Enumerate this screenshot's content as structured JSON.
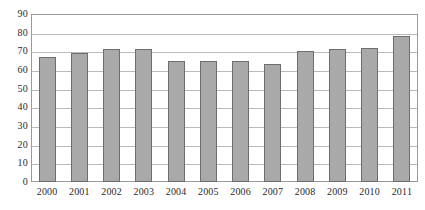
{
  "chart_data": {
    "type": "bar",
    "title": "",
    "subtitle": "",
    "xlabel": "",
    "ylabel": "",
    "categories": [
      "2000",
      "2001",
      "2002",
      "2003",
      "2004",
      "2005",
      "2006",
      "2007",
      "2008",
      "2009",
      "2010",
      "2011"
    ],
    "values": [
      67,
      69,
      71,
      71,
      65,
      65,
      65,
      63,
      70,
      71,
      72,
      78
    ],
    "ylim": [
      0,
      90
    ],
    "ytick_labels": [
      "90",
      "80",
      "70",
      "60",
      "50",
      "40",
      "30",
      "20",
      "10",
      "0"
    ],
    "ytick_values": [
      90,
      80,
      70,
      60,
      50,
      40,
      30,
      20,
      10,
      0
    ],
    "grid": true,
    "legend": "none",
    "series": [
      {
        "name": "",
        "values": [
          67,
          69,
          71,
          71,
          65,
          65,
          65,
          63,
          70,
          71,
          72,
          78
        ]
      }
    ],
    "colors": {
      "bar_fill": "#a9a9a9",
      "bar_border": "#6e6e6e",
      "gridline": "#b9b9b9",
      "frame": "#9a9a9a",
      "text": "#2b2b2b",
      "background": "#ffffff"
    }
  }
}
